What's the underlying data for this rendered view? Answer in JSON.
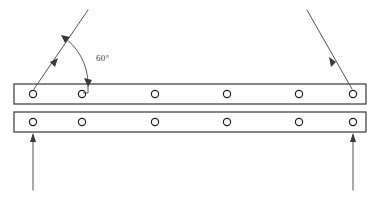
{
  "diagram": {
    "background_color": "#ffffff",
    "line_color": "#2e2e2e",
    "force_color": "#4a4a4a",
    "annotations": {
      "angle_label": "60°"
    },
    "bars": [
      {
        "name": "top-bar",
        "x": 14,
        "y": 84,
        "width": 352,
        "height": 20
      },
      {
        "name": "bottom-bar",
        "x": 14,
        "y": 112,
        "width": 352,
        "height": 20
      }
    ],
    "hole_centers_x": [
      33,
      82,
      155,
      227,
      299,
      353
    ],
    "hole_radius": 3.6,
    "top_hole_cy": 94,
    "bottom_hole_cy": 122,
    "forces": [
      {
        "name": "left-applied-force",
        "type": "diagonal",
        "from_x": 88,
        "from_y": 10,
        "to_x": 33,
        "to_y": 90,
        "direction": "down-left"
      },
      {
        "name": "right-applied-force",
        "type": "diagonal",
        "from_x": 307,
        "from_y": 10,
        "to_x": 353,
        "to_y": 90,
        "direction": "down-right"
      },
      {
        "name": "left-reaction-force",
        "type": "vertical",
        "from_x": 33,
        "from_y": 190,
        "to_x": 33,
        "to_y": 134,
        "direction": "up"
      },
      {
        "name": "right-reaction-force",
        "type": "vertical",
        "from_x": 353,
        "from_y": 190,
        "to_x": 353,
        "to_y": 134,
        "direction": "up"
      }
    ],
    "angle_arc": {
      "name": "sixty-degree-arc",
      "vertex_x": 82,
      "vertex_y": 92,
      "label": "60°",
      "label_x": 96,
      "label_y": 58,
      "start_x": 62,
      "start_y": 36,
      "end_x": 88,
      "end_y": 84
    }
  }
}
